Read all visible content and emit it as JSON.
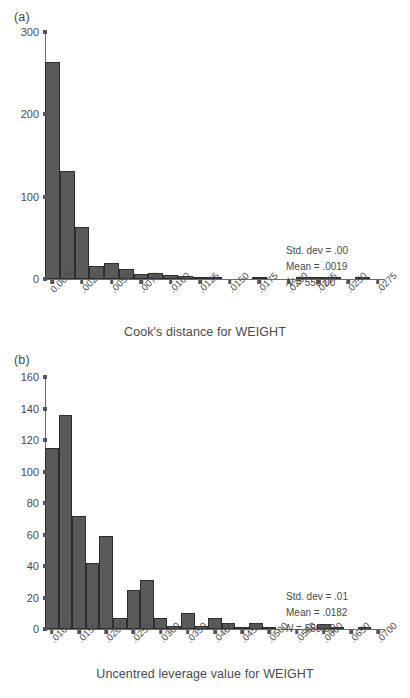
{
  "figure": {
    "background": "#ffffff",
    "bar_fill": "#5a5a5a",
    "bar_edge": "#2e2e2e",
    "axis_color": "#6b6b6b",
    "text_color": "#4a4a4a"
  },
  "panels": [
    {
      "panel_label": "(a)",
      "stats": {
        "std_dev": "Std. dev = .00",
        "mean": "Mean = .0019",
        "n_prefix": "N",
        "n_value": " = 550.00"
      }
    },
    {
      "panel_label": "(b)",
      "stats": {
        "std_dev": "Std. dev = .01",
        "mean": "Mean = .0182",
        "n_prefix": "N",
        "n_value": " = 550.00"
      }
    }
  ],
  "chart_data": [
    {
      "type": "bar",
      "title": "",
      "panel": "(a)",
      "xlabel": "Cook's distance for WEIGHT",
      "ylabel": "",
      "ylim": [
        0,
        300
      ],
      "yticks": [
        0,
        100,
        200,
        300
      ],
      "ytick_labels": [
        "0",
        "100",
        "200",
        "300"
      ],
      "xtick_labels": [
        "0.0000",
        ".0025",
        ".0050",
        ".0075",
        ".0100",
        ".0125",
        ".0150",
        ".0175",
        ".0200",
        ".0225",
        ".0250",
        ".0275"
      ],
      "xtick_values": [
        0.0,
        0.0025,
        0.005,
        0.0075,
        0.01,
        0.0125,
        0.015,
        0.0175,
        0.02,
        0.0225,
        0.025,
        0.0275
      ],
      "xlim": [
        -0.000625,
        0.028125
      ],
      "bin_width": 0.00125,
      "bin_centers": [
        0.0,
        0.00125,
        0.0025,
        0.00375,
        0.005,
        0.00625,
        0.0075,
        0.00875,
        0.01,
        0.01125,
        0.0125,
        0.01375,
        0.015,
        0.01625,
        0.0175,
        0.01875,
        0.02,
        0.02125,
        0.0225,
        0.02375,
        0.025,
        0.02625,
        0.0275
      ],
      "values": [
        264,
        131,
        63,
        16,
        19,
        12,
        6,
        7,
        5,
        4,
        3,
        1,
        0,
        0,
        3,
        0,
        0,
        1,
        1,
        1,
        0,
        1,
        0
      ],
      "grid": false,
      "legend": "none",
      "stat_annotations": [
        "Std. dev = .00",
        "Mean = .0019",
        "N = 550.00"
      ]
    },
    {
      "type": "bar",
      "title": "",
      "panel": "(b)",
      "xlabel": "Uncentred leverage value for WEIGHT",
      "ylabel": "",
      "ylim": [
        0,
        160
      ],
      "yticks": [
        0,
        20,
        40,
        60,
        80,
        100,
        120,
        140,
        160
      ],
      "ytick_labels": [
        "0",
        "20",
        "40",
        "60",
        "80",
        "100",
        "120",
        "140",
        "160"
      ],
      "xtick_labels": [
        ".0100",
        ".0150",
        ".0200",
        ".0250",
        ".0300",
        ".0350",
        ".0400",
        ".0450",
        ".0500",
        ".0550",
        ".0600",
        ".0650",
        ".0700"
      ],
      "xtick_values": [
        0.01,
        0.015,
        0.02,
        0.025,
        0.03,
        0.035,
        0.04,
        0.045,
        0.05,
        0.055,
        0.06,
        0.065,
        0.07
      ],
      "xlim": [
        0.00875,
        0.07125
      ],
      "bin_width": 0.0025,
      "bin_centers": [
        0.01,
        0.0125,
        0.015,
        0.0175,
        0.02,
        0.0225,
        0.025,
        0.0275,
        0.03,
        0.0325,
        0.035,
        0.0375,
        0.04,
        0.0425,
        0.045,
        0.0475,
        0.05,
        0.0525,
        0.055,
        0.0575,
        0.06,
        0.0625,
        0.065,
        0.0675,
        0.07
      ],
      "values": [
        115,
        136,
        72,
        42,
        59,
        7,
        25,
        31,
        7,
        2,
        10,
        2,
        7,
        4,
        1,
        4,
        1,
        0,
        0,
        0,
        3,
        1,
        0,
        1,
        0
      ],
      "grid": false,
      "legend": "none",
      "stat_annotations": [
        "Std. dev = .01",
        "Mean = .0182",
        "N = 550.00"
      ]
    }
  ]
}
